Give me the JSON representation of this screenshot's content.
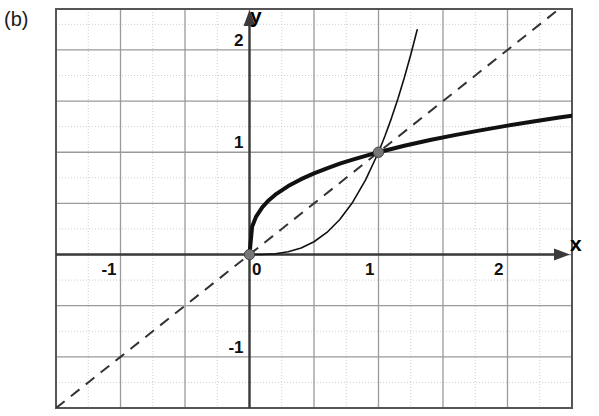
{
  "figure": {
    "panel_label": "(b)",
    "background_color": "#ffffff",
    "frame_color": "#555555",
    "major_grid_color": "#9a9a9a",
    "minor_grid_color": "#cfcfcf",
    "axis_color": "#3a3a3a",
    "curve_color": "#111111"
  },
  "chart_data": {
    "type": "line",
    "title": "",
    "subtitle": "",
    "xlabel": "x",
    "ylabel": "y",
    "xlim": [
      -1.5,
      2.5
    ],
    "ylim": [
      -1.5,
      2.4
    ],
    "grid": true,
    "grid_major_step": 0.5,
    "grid_minor_step": 0.25,
    "legend": "none",
    "xticks": [
      -1,
      0,
      1,
      2
    ],
    "xtick_labels": [
      "-1",
      "0",
      "1",
      "2"
    ],
    "yticks": [
      -1,
      1,
      2
    ],
    "ytick_labels": [
      "-1",
      "1",
      "2"
    ],
    "annotations": [
      {
        "label": "(b)",
        "x": -1.55,
        "y": 2.35
      },
      {
        "label": "x",
        "x": 2.48,
        "y": 0.26
      },
      {
        "label": "y",
        "x": 0.1,
        "y": 2.35
      }
    ],
    "markers": [
      {
        "x": 0,
        "y": 0,
        "style": "filled-circle",
        "color": "#777777"
      },
      {
        "x": 1,
        "y": 1,
        "style": "filled-circle",
        "color": "#777777"
      }
    ],
    "series": [
      {
        "name": "identity",
        "label": "y = x",
        "style": "dashed",
        "width": 2,
        "color": "#333333",
        "x": [
          -1.5,
          -1.25,
          -1,
          -0.75,
          -0.5,
          -0.25,
          0,
          0.25,
          0.5,
          0.75,
          1,
          1.25,
          1.5,
          1.75,
          2,
          2.25,
          2.4
        ],
        "values": [
          -1.5,
          -1.25,
          -1,
          -0.75,
          -0.5,
          -0.25,
          0,
          0.25,
          0.5,
          0.75,
          1,
          1.25,
          1.5,
          1.75,
          2,
          2.25,
          2.4
        ]
      },
      {
        "name": "cube-root",
        "label": "y = x^(1/3)",
        "style": "solid-thick",
        "width": 4,
        "color": "#111111",
        "x": [
          0,
          0.02,
          0.05,
          0.1,
          0.15,
          0.2,
          0.3,
          0.4,
          0.5,
          0.6,
          0.7,
          0.8,
          0.9,
          1,
          1.2,
          1.4,
          1.6,
          1.8,
          2,
          2.2,
          2.4,
          2.5
        ],
        "values": [
          0,
          0.271,
          0.368,
          0.464,
          0.531,
          0.585,
          0.669,
          0.737,
          0.794,
          0.843,
          0.888,
          0.928,
          0.965,
          1,
          1.063,
          1.119,
          1.17,
          1.216,
          1.26,
          1.301,
          1.339,
          1.357
        ]
      },
      {
        "name": "cube",
        "label": "y = x^3",
        "style": "solid-thin",
        "width": 1.6,
        "color": "#111111",
        "x": [
          0,
          0.1,
          0.2,
          0.3,
          0.4,
          0.5,
          0.6,
          0.7,
          0.8,
          0.9,
          1,
          1.05,
          1.1,
          1.15,
          1.2,
          1.25,
          1.3
        ],
        "values": [
          0,
          0.001,
          0.008,
          0.027,
          0.064,
          0.125,
          0.216,
          0.343,
          0.512,
          0.729,
          1,
          1.158,
          1.331,
          1.521,
          1.728,
          1.953,
          2.197
        ]
      }
    ]
  }
}
